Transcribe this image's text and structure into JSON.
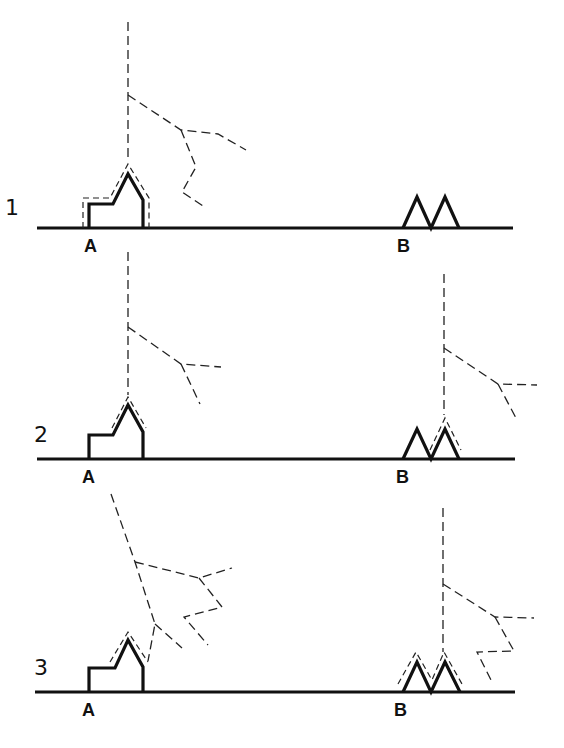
{
  "panels": [
    {
      "number": "1",
      "label_a": "A",
      "label_b": "B",
      "description": "Lightning leader approaches church at A; twin towers at B unaffected"
    },
    {
      "number": "2",
      "label_a": "A",
      "label_b": "B",
      "description": "Leaders descend above both A and B with upward streamers"
    },
    {
      "number": "3",
      "label_a": "A",
      "label_b": "B",
      "description": "Branched leaders near A and B, streamers rising from both structures"
    }
  ],
  "colors": {
    "ink": "#111111",
    "background": "#ffffff"
  }
}
